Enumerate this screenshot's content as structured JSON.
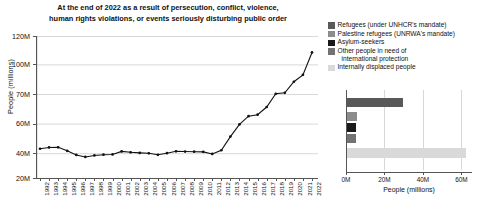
{
  "colors": {
    "refugees": "#595959",
    "palestine": "#8c8c8c",
    "asylum": "#1a1a1a",
    "other": "#737373",
    "idp": "#d9d9d9",
    "line": "#111111",
    "grid": "#d8d8d8",
    "axis": "#555555"
  },
  "line_chart": {
    "title_line1": "At the end of 2022 as a result of persecution, conflict, violence,",
    "title_line2": "human rights violations, or events seriously disturbing public order",
    "ylabel": "People (millions)",
    "ytick_labels": [
      "120M",
      "100M",
      "70M",
      "60M",
      "40M",
      "20M"
    ]
  },
  "legend": {
    "items": [
      {
        "label": "Refugees (under UNHCR's mandate)",
        "label2": "",
        "color_key": "refugees"
      },
      {
        "label": "Palestine refugees (UNRWA's mandate)",
        "label2": "",
        "color_key": "palestine"
      },
      {
        "label": "Asylum-seekers",
        "label2": "",
        "color_key": "asylum"
      },
      {
        "label": "Other people in need of",
        "label2": "international protection",
        "color_key": "other"
      },
      {
        "label": "Internally displaced people",
        "label2": "",
        "color_key": "idp"
      }
    ]
  },
  "bar_chart": {
    "xlabel": "People (millions)",
    "xtick_labels": [
      "0M",
      "20M",
      "40M",
      "60M"
    ]
  },
  "chart_data": [
    {
      "type": "line",
      "title": "At the end of 2022 as a result of persecution, conflict, violence, human rights violations, or events seriously disturbing public order",
      "xlabel": "",
      "ylabel": "People (millions)",
      "grid": true,
      "legend_position": "none",
      "ytick_values": [
        120,
        100,
        70,
        60,
        40,
        20
      ],
      "ytick_labels": [
        "120M",
        "100M",
        "70M",
        "60M",
        "40M",
        "20M"
      ],
      "yaxis_note": "non-linear spacing: ticks evenly spaced in pixels",
      "xlim": [
        1992,
        2022
      ],
      "x": [
        1992,
        1993,
        1994,
        1995,
        1996,
        1997,
        1998,
        1999,
        2000,
        2001,
        2002,
        2003,
        2004,
        2005,
        2006,
        2007,
        2008,
        2009,
        2010,
        2011,
        2012,
        2013,
        2014,
        2015,
        2016,
        2017,
        2018,
        2019,
        2020,
        2021,
        2022
      ],
      "values": [
        43.0,
        43.9,
        44.0,
        41.6,
        38.6,
        37.0,
        38.2,
        38.8,
        39.0,
        41.2,
        40.6,
        40.2,
        39.9,
        38.7,
        40.0,
        41.3,
        41.1,
        41.0,
        40.9,
        39.4,
        42.0,
        51.2,
        59.5,
        62.5,
        63.0,
        65.6,
        70.2,
        71.2,
        82.4,
        89.4,
        108.4
      ],
      "value_unit": "millions of people"
    },
    {
      "type": "bar",
      "orientation": "horizontal",
      "xlabel": "People (millions)",
      "ylabel": "",
      "grid": true,
      "legend_position": "top",
      "xlim": [
        0,
        65
      ],
      "xtick_values": [
        0,
        20,
        40,
        60
      ],
      "xtick_labels": [
        "0M",
        "20M",
        "40M",
        "60M"
      ],
      "categories": [
        "Refugees (under UNHCR's mandate)",
        "Palestine refugees (UNRWA's mandate)",
        "Asylum-seekers",
        "Other people in need of international protection",
        "Internally displaced people"
      ],
      "values": [
        29.4,
        5.9,
        5.4,
        5.2,
        62.5
      ],
      "value_unit": "millions of people"
    }
  ]
}
